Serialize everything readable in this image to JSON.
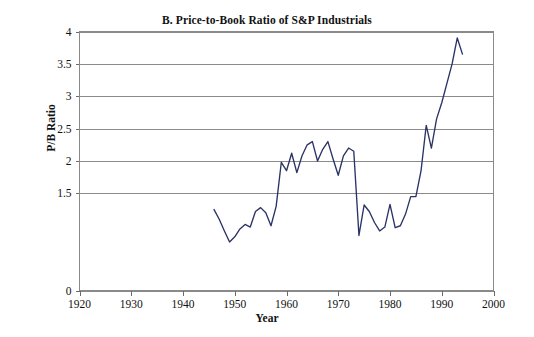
{
  "figure": {
    "panel_label": "B.",
    "title": "B. Price-to-Book Ratio of  S&P Industrials",
    "background_color": "#ffffff",
    "line_color": "#2a3365",
    "grid_color": "#8a8a8a"
  },
  "chart_data": {
    "type": "line",
    "title": "B. Price-to-Book Ratio of  S&P Industrials",
    "xlabel": "Year",
    "ylabel": "P/B Ratio",
    "xlim": [
      1920,
      2000
    ],
    "ylim": [
      0,
      4
    ],
    "grid": true,
    "legend": null,
    "xticks": [
      1920,
      1930,
      1940,
      1950,
      1960,
      1970,
      1980,
      1990,
      2000
    ],
    "xtick_labels": [
      "1920",
      "1930",
      "1940",
      "1950",
      "1960",
      "1970",
      "1980",
      "1990",
      "2000"
    ],
    "yticks": [
      0,
      1.5,
      2,
      2.5,
      3,
      3.5,
      4
    ],
    "ytick_labels": [
      "0",
      "1.5",
      "2",
      "2.5",
      "3",
      "3.5",
      "4"
    ],
    "gridlines_y": [
      0,
      1.5,
      2,
      2.5,
      3,
      3.5,
      4
    ],
    "series": [
      {
        "name": "P/B Ratio of S&P Industrials",
        "color": "#2a3365",
        "x": [
          1946,
          1947,
          1948,
          1949,
          1950,
          1951,
          1952,
          1953,
          1954,
          1955,
          1956,
          1957,
          1958,
          1959,
          1960,
          1961,
          1962,
          1963,
          1964,
          1965,
          1966,
          1967,
          1968,
          1969,
          1970,
          1971,
          1972,
          1973,
          1974,
          1975,
          1976,
          1977,
          1978,
          1979,
          1980,
          1981,
          1982,
          1983,
          1984,
          1985,
          1986,
          1987,
          1988,
          1989,
          1990,
          1991,
          1992,
          1993,
          1994
        ],
        "y": [
          1.25,
          1.1,
          0.92,
          0.75,
          0.83,
          0.95,
          1.02,
          0.98,
          1.22,
          1.28,
          1.2,
          1.0,
          1.3,
          1.98,
          1.85,
          2.12,
          1.82,
          2.08,
          2.25,
          2.3,
          2.0,
          2.18,
          2.3,
          2.03,
          1.78,
          2.08,
          2.2,
          2.15,
          0.85,
          1.32,
          1.22,
          1.05,
          0.92,
          0.98,
          1.33,
          0.97,
          1.0,
          1.18,
          1.45,
          1.45,
          1.85,
          2.55,
          2.2,
          2.65,
          2.9,
          3.2,
          3.5,
          3.9,
          3.65
        ]
      }
    ]
  }
}
